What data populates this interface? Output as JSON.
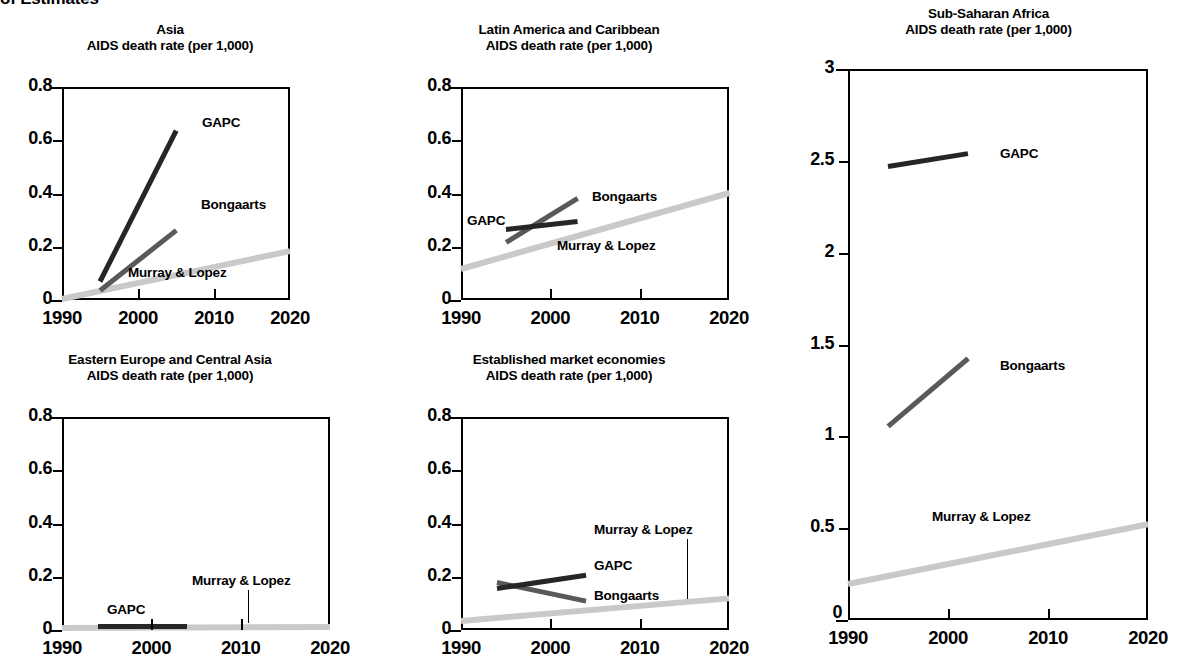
{
  "page": {
    "heading": "of Estimates"
  },
  "axis": {
    "x_ticks": [
      "1990",
      "2000",
      "2010",
      "2020"
    ],
    "y_ticks_small": [
      "0",
      "0.2",
      "0.4",
      "0.6",
      "0.8"
    ],
    "y_ticks_africa": [
      "0",
      "0.5",
      "1",
      "1.5",
      "2",
      "2.5",
      "3"
    ]
  },
  "series_colors": {
    "gapc": "#262626",
    "bongaarts": "#595959",
    "murray_lopez": "#c9c9c9"
  },
  "series_labels": {
    "gapc": "GAPC",
    "bongaarts": "Bongaarts",
    "murray_lopez": "Murray & Lopez"
  },
  "chart_data": [
    {
      "id": "asia",
      "type": "line",
      "title": "Asia",
      "subtitle": "AIDS death rate (per 1,000)",
      "xlabel": "",
      "ylabel": "AIDS death rate (per 1,000)",
      "xlim": [
        1990,
        2020
      ],
      "ylim": [
        0,
        0.8
      ],
      "grid": false,
      "legend": "inline-annotations",
      "series": [
        {
          "name": "GAPC",
          "x": [
            1995,
            2005
          ],
          "values": [
            0.07,
            0.635
          ]
        },
        {
          "name": "Bongaarts",
          "x": [
            1995,
            2005
          ],
          "values": [
            0.035,
            0.26
          ]
        },
        {
          "name": "Murray & Lopez",
          "x": [
            1990,
            2020
          ],
          "values": [
            0.005,
            0.185
          ]
        }
      ]
    },
    {
      "id": "latin-america-caribbean",
      "type": "line",
      "title": "Latin America and Caribbean",
      "subtitle": "AIDS death rate (per 1,000)",
      "xlabel": "",
      "ylabel": "AIDS death rate (per 1,000)",
      "xlim": [
        1990,
        2020
      ],
      "ylim": [
        0,
        0.8
      ],
      "grid": false,
      "legend": "inline-annotations",
      "series": [
        {
          "name": "GAPC",
          "x": [
            1995,
            2003
          ],
          "values": [
            0.265,
            0.295
          ]
        },
        {
          "name": "Bongaarts",
          "x": [
            1995,
            2003
          ],
          "values": [
            0.215,
            0.38
          ]
        },
        {
          "name": "Murray & Lopez",
          "x": [
            1990,
            2020
          ],
          "values": [
            0.115,
            0.4
          ]
        }
      ]
    },
    {
      "id": "sub-saharan-africa",
      "type": "line",
      "title": "Sub-Saharan Africa",
      "subtitle": "AIDS death rate (per 1,000)",
      "xlabel": "",
      "ylabel": "AIDS death rate (per 1,000)",
      "xlim": [
        1990,
        2020
      ],
      "ylim": [
        0,
        3
      ],
      "grid": false,
      "legend": "inline-annotations",
      "series": [
        {
          "name": "GAPC",
          "x": [
            1994,
            2002
          ],
          "values": [
            2.47,
            2.54
          ]
        },
        {
          "name": "Bongaarts",
          "x": [
            1994,
            2002
          ],
          "values": [
            1.055,
            1.425
          ]
        },
        {
          "name": "Murray & Lopez",
          "x": [
            1990,
            2020
          ],
          "values": [
            0.195,
            0.52
          ]
        }
      ]
    },
    {
      "id": "eastern-europe-central-asia",
      "type": "line",
      "title": "Eastern Europe and Central Asia",
      "subtitle": "AIDS death rate (per 1,000)",
      "xlabel": "",
      "ylabel": "AIDS death rate (per 1,000)",
      "xlim": [
        1990,
        2020
      ],
      "ylim": [
        0,
        0.8
      ],
      "grid": false,
      "legend": "inline-annotations",
      "series": [
        {
          "name": "GAPC",
          "x": [
            1994,
            2004
          ],
          "values": [
            0.014,
            0.014
          ]
        },
        {
          "name": "Murray & Lopez",
          "x": [
            1990,
            2020
          ],
          "values": [
            0.008,
            0.012
          ]
        }
      ]
    },
    {
      "id": "established-market-economies",
      "type": "line",
      "title": "Established market economies",
      "subtitle": "AIDS death rate (per 1,000)",
      "xlabel": "",
      "ylabel": "AIDS death rate (per 1,000)",
      "xlim": [
        1990,
        2020
      ],
      "ylim": [
        0,
        0.8
      ],
      "grid": false,
      "legend": "inline-annotations",
      "series": [
        {
          "name": "GAPC",
          "x": [
            1994,
            2004
          ],
          "values": [
            0.155,
            0.205
          ]
        },
        {
          "name": "Bongaarts",
          "x": [
            1994,
            2004
          ],
          "values": [
            0.18,
            0.11
          ]
        },
        {
          "name": "Murray & Lopez",
          "x": [
            1990,
            2020
          ],
          "values": [
            0.035,
            0.12
          ]
        }
      ]
    }
  ]
}
